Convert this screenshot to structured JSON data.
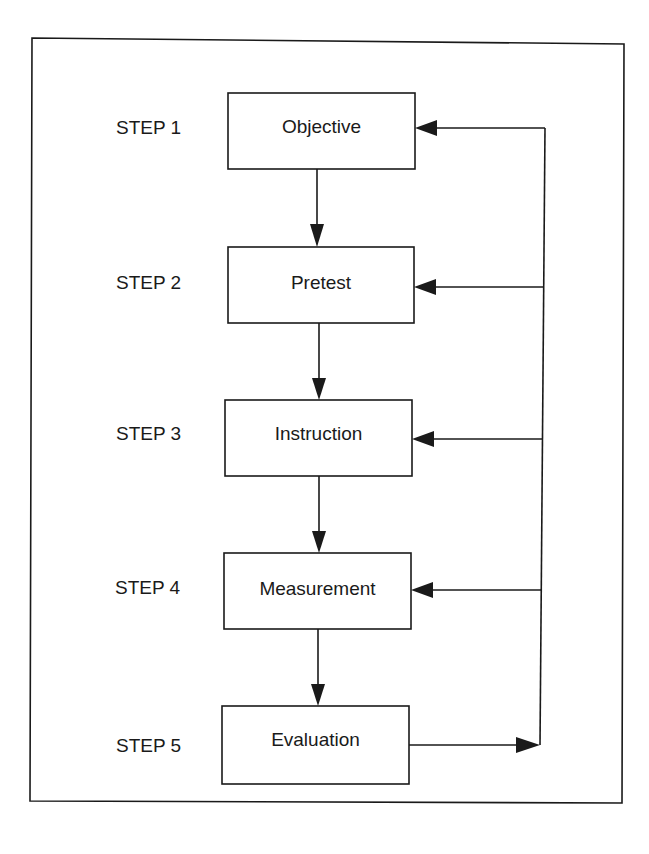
{
  "diagram": {
    "type": "flowchart",
    "steps": [
      {
        "step_label": "STEP 1",
        "box_label": "Objective"
      },
      {
        "step_label": "STEP 2",
        "box_label": "Pretest"
      },
      {
        "step_label": "STEP 3",
        "box_label": "Instruction"
      },
      {
        "step_label": "STEP 4",
        "box_label": "Measurement"
      },
      {
        "step_label": "STEP 5",
        "box_label": "Evaluation"
      }
    ],
    "feedback_loop": "Evaluation feeds back to Objective, Pretest, Instruction, Measurement",
    "colors": {
      "line": "#1a1a1a",
      "background": "#ffffff"
    }
  }
}
